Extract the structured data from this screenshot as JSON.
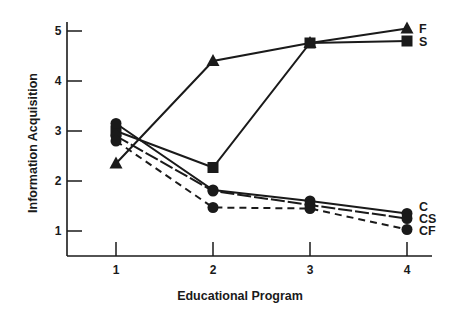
{
  "chart_data": {
    "type": "line",
    "title": "",
    "xlabel": "Educational Program",
    "ylabel": "Information Acquisition",
    "x": [
      1,
      2,
      3,
      4
    ],
    "x_tick_labels": [
      "1",
      "2",
      "3",
      "4"
    ],
    "y_tick_labels": [
      "1",
      "2",
      "3",
      "4",
      "5"
    ],
    "y_ticks": [
      1,
      2,
      3,
      4,
      5
    ],
    "xlim": [
      0.5,
      4.25
    ],
    "ylim": [
      0.5,
      5.3
    ],
    "grid": false,
    "legend_position": "direct labels at right end of lines",
    "series": [
      {
        "name": "F",
        "marker": "triangle",
        "line": "solid",
        "values": [
          2.35,
          4.4,
          4.76,
          5.05
        ]
      },
      {
        "name": "S",
        "marker": "square",
        "line": "solid",
        "values": [
          3.0,
          2.27,
          4.76,
          4.8
        ]
      },
      {
        "name": "C",
        "marker": "circle",
        "line": "solid",
        "values": [
          3.15,
          1.82,
          1.6,
          1.35
        ]
      },
      {
        "name": "CS",
        "marker": "circle",
        "line": "long-dash",
        "values": [
          2.9,
          1.8,
          1.52,
          1.25
        ]
      },
      {
        "name": "CF",
        "marker": "circle",
        "line": "dashed",
        "values": [
          2.8,
          1.47,
          1.45,
          1.03
        ]
      }
    ],
    "colors": {
      "ink": "#1a1a1a",
      "background": "#ffffff"
    }
  }
}
